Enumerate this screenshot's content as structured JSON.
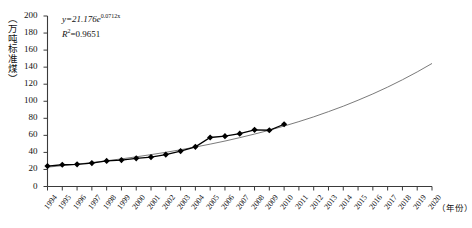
{
  "chart_data": {
    "type": "line",
    "title": "",
    "xlabel": "（年份）",
    "ylabel": "（万吨标准煤）",
    "equation": "y=21.176e",
    "equation_exponent": "0.0712x",
    "r_squared_label": "R",
    "r_squared_sup": "2",
    "r_squared_value": "=0.9651",
    "fit_formula_a": 21.176,
    "fit_formula_b": 0.0712,
    "r_squared": 0.9651,
    "ylim": [
      0,
      200
    ],
    "ytick_step": 20,
    "yticks": [
      0,
      20,
      40,
      60,
      80,
      100,
      120,
      140,
      160,
      180,
      200
    ],
    "xticks": [
      "1994",
      "1995",
      "1996",
      "1997",
      "1998",
      "1999",
      "2000",
      "2001",
      "2002",
      "2003",
      "2004",
      "2005",
      "2006",
      "2007",
      "2008",
      "2009",
      "2010",
      "2011",
      "2012",
      "2013",
      "2014",
      "2015",
      "2016",
      "2017",
      "2018",
      "2019",
      "2020"
    ],
    "xlim": [
      1994,
      2020
    ],
    "grid": false,
    "legend": "none",
    "series": [
      {
        "name": "实际值",
        "marker": "diamond",
        "color": "#000000",
        "x": [
          1994,
          1995,
          1996,
          1997,
          1998,
          1999,
          2000,
          2001,
          2002,
          2003,
          2004,
          2005,
          2006,
          2007,
          2008,
          2009,
          2010
        ],
        "values": [
          24,
          25.5,
          26,
          27.5,
          30,
          31,
          33,
          34.5,
          37.5,
          41.5,
          46.5,
          57.5,
          59,
          62,
          66.5,
          66,
          73
        ]
      },
      {
        "name": "指数拟合曲线",
        "marker": "none",
        "color": "#6b6b6b",
        "x": [
          1994,
          1995,
          1996,
          1997,
          1998,
          1999,
          2000,
          2001,
          2002,
          2003,
          2004,
          2005,
          2006,
          2007,
          2008,
          2009,
          2010,
          2011,
          2012,
          2013,
          2014,
          2015,
          2016,
          2017,
          2018,
          2019,
          2020
        ],
        "values": [
          22.7,
          24.4,
          26.2,
          28.1,
          30.2,
          32.4,
          34.8,
          37.4,
          40.1,
          43.1,
          46.3,
          49.7,
          53.3,
          57.3,
          61.5,
          66.0,
          70.9,
          76.1,
          81.7,
          87.8,
          94.2,
          101.2,
          108.6,
          116.6,
          125.2,
          134.4,
          144.3
        ]
      }
    ]
  }
}
